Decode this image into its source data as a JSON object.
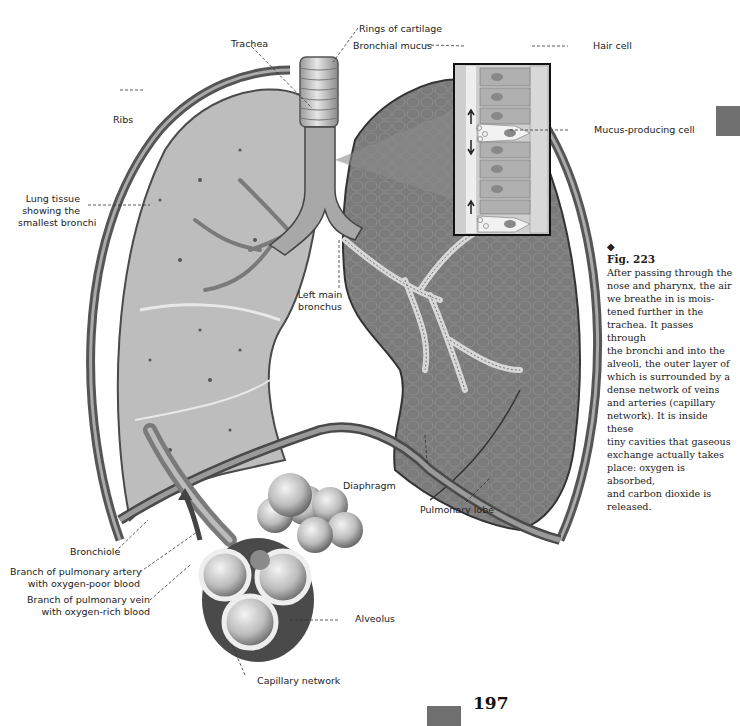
{
  "figure": {
    "number": "Fig. 223",
    "marker": "◆",
    "caption": "After passing through the nose and pharynx, the air we breathe in is moistened further in the trachea. It passes through the bronchi and into the alveoli, the outer layer of which is surrounded by a dense network of veins and arteries (capillary network). It is inside these tiny cavities that gaseous exchange actually takes place: oxygen is absorbed, and carbon dioxide is released.",
    "caption_lines": [
      "After passing through the",
      "nose and pharynx, the air",
      "we breathe in is mois-",
      "tened further in the",
      "trachea. It passes through",
      "the bronchi and into the",
      "alveoli, the outer layer of",
      "which is surrounded by a",
      "dense network of veins",
      "and arteries (capillary",
      "network). It is inside these",
      "tiny cavities that gaseous",
      "exchange actually takes",
      "place: oxygen is absorbed,",
      "and carbon dioxide is",
      "released."
    ]
  },
  "labels": {
    "rings_of_cartilage": "Rings of cartilage",
    "trachea": "Trachea",
    "bronchial_mucus": "Bronchial mucus",
    "hair_cell": "Hair cell",
    "mucus_producing_cell": "Mucus-producing cell",
    "ribs": "Ribs",
    "lung_tissue_1": "Lung tissue",
    "lung_tissue_2": "showing the",
    "lung_tissue_3": "smallest bronchi",
    "left_main_bronchus_1": "Left main",
    "left_main_bronchus_2": "bronchus",
    "diaphragm": "Diaphragm",
    "pulmonary_lobe": "Pulmonary lobe",
    "bronchiole": "Bronchiole",
    "artery_1": "Branch of pulmonary artery",
    "artery_2": "with oxygen-poor blood",
    "vein_1": "Branch of pulmonary vein",
    "vein_2": "with oxygen-rich blood",
    "alveolus": "Alveolus",
    "capillary_network": "Capillary network"
  },
  "page": {
    "number": "197"
  },
  "colors": {
    "left_lung": "#bdbdbd",
    "right_lung": "#7a7a7a",
    "page_tab": "#6f6f6f"
  }
}
